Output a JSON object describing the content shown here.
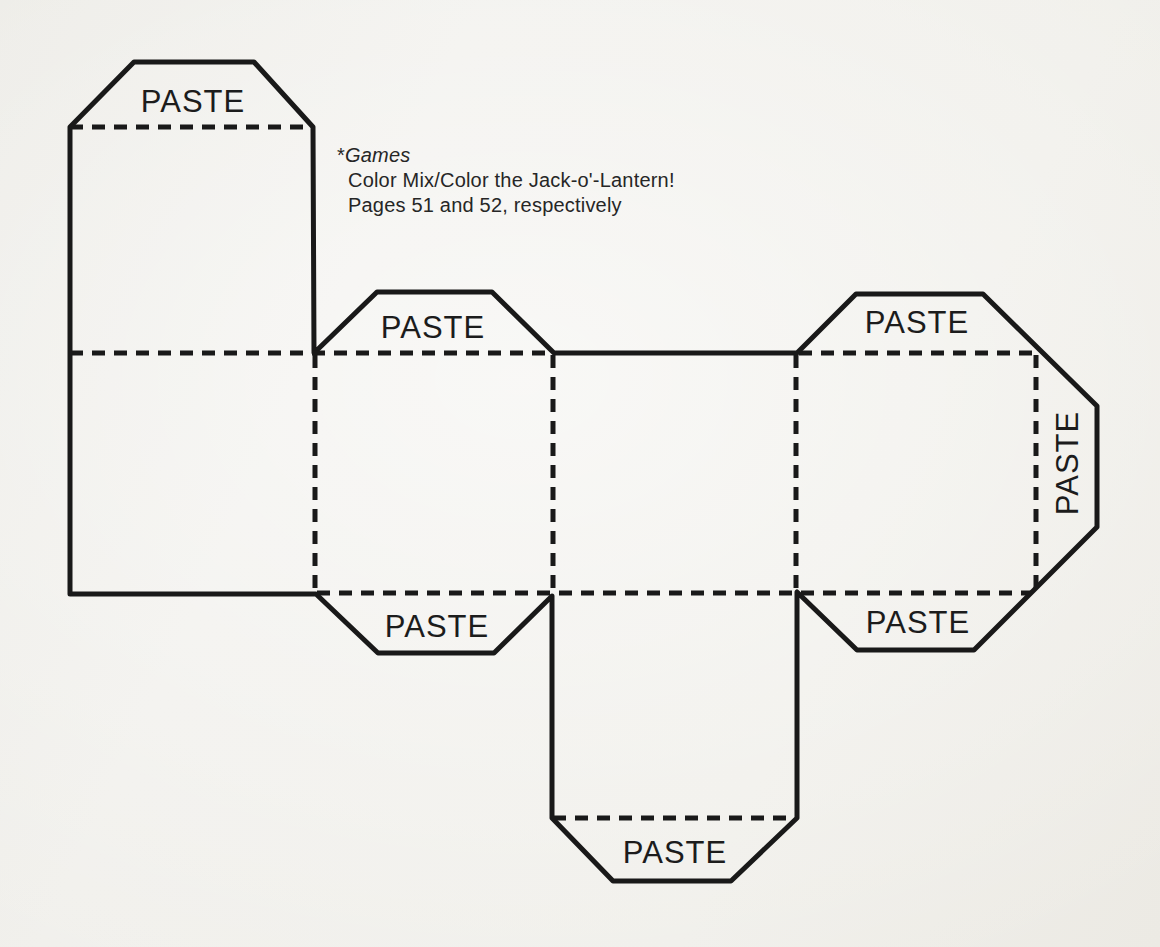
{
  "colors": {
    "paper": "#f0efea",
    "ink": "#191919",
    "text": "#262626"
  },
  "caption": {
    "marker": "*",
    "series_title": "Games",
    "line2": "Color Mix/Color the Jack-o'-Lantern!",
    "line3": "Pages 51 and 52, respectively"
  },
  "template": {
    "kind": "cube-box cut-out pattern with glue tabs",
    "tabs": [
      {
        "id": "lid-top-tab",
        "location": "above lid square, top left",
        "label": "PASTE"
      },
      {
        "id": "face2-top-tab",
        "location": "above second face of middle strip",
        "label": "PASTE"
      },
      {
        "id": "face4-top-tab",
        "location": "above fourth face of middle strip",
        "label": "PASTE"
      },
      {
        "id": "face4-right-tab",
        "location": "right side of fourth face, label rotated 90deg",
        "label": "PASTE"
      },
      {
        "id": "face2-bottom-tab",
        "location": "below second face of middle strip",
        "label": "PASTE"
      },
      {
        "id": "face4-bottom-tab",
        "location": "below fourth face of middle strip",
        "label": "PASTE"
      },
      {
        "id": "bottom-flap-tab",
        "location": "below bottom square flap",
        "label": "PASTE"
      }
    ]
  }
}
